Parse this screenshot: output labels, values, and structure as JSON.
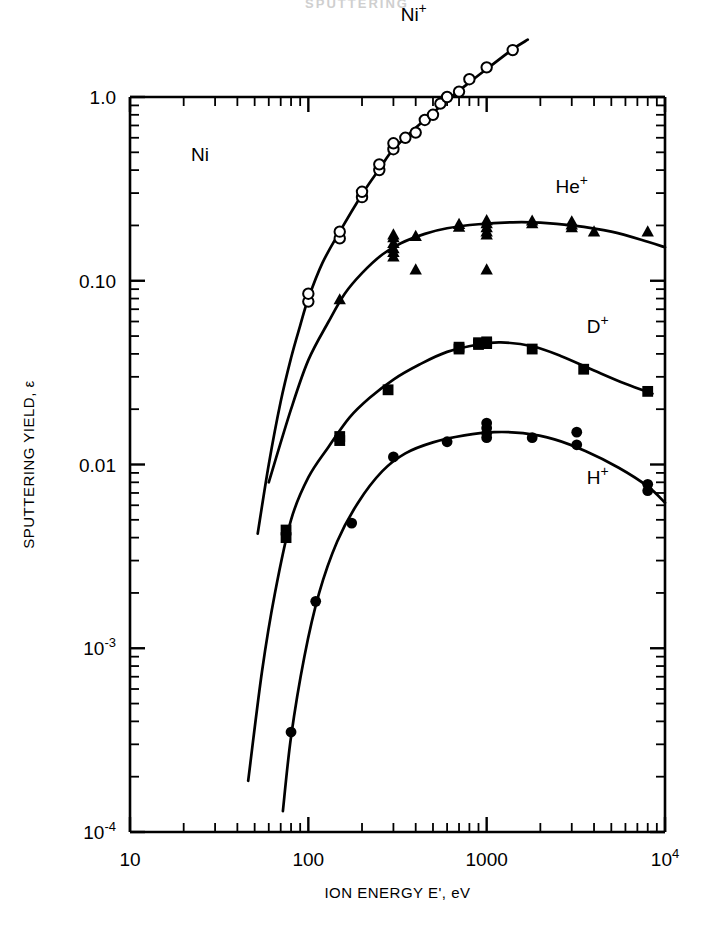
{
  "page": {
    "header_partial": "SPUTTERING"
  },
  "chart_data": {
    "type": "scatter",
    "title": "",
    "xlabel": "ION ENERGY E', eV",
    "ylabel": "SPUTTERING YIELD, ε",
    "xscale": "log",
    "yscale": "log",
    "xlim": [
      10,
      10000
    ],
    "ylim": [
      0.0001,
      1.0
    ],
    "grid": false,
    "legend_position": "inline-annotations",
    "annotations": [
      {
        "text": "Ni",
        "x": 22,
        "y": 0.45,
        "name": "target-material-label"
      }
    ],
    "xticks": [
      {
        "value": 10,
        "label": "10"
      },
      {
        "value": 100,
        "label": "100"
      },
      {
        "value": 1000,
        "label": "1000"
      },
      {
        "value": 10000,
        "label": "10",
        "sup": "4"
      }
    ],
    "yticks": [
      {
        "value": 1.0,
        "label": "1.0"
      },
      {
        "value": 0.1,
        "label": "0.10"
      },
      {
        "value": 0.01,
        "label": "0.01"
      },
      {
        "value": 0.001,
        "label": "10",
        "sup": "-3"
      },
      {
        "value": 0.0001,
        "label": "10",
        "sup": "-4"
      }
    ],
    "series": [
      {
        "name": "Ni+",
        "label": "Ni",
        "label_sup": "+",
        "label_x": 390,
        "label_y": 2.6,
        "marker": "open-circle",
        "points": [
          [
            100,
            0.077
          ],
          [
            100,
            0.085
          ],
          [
            150,
            0.17
          ],
          [
            150,
            0.185
          ],
          [
            200,
            0.285
          ],
          [
            200,
            0.305
          ],
          [
            250,
            0.4
          ],
          [
            250,
            0.43
          ],
          [
            300,
            0.52
          ],
          [
            300,
            0.56
          ],
          [
            350,
            0.6
          ],
          [
            400,
            0.64
          ],
          [
            450,
            0.75
          ],
          [
            500,
            0.8
          ],
          [
            550,
            0.92
          ],
          [
            600,
            1.0
          ],
          [
            700,
            1.07
          ],
          [
            800,
            1.25
          ],
          [
            1000,
            1.45
          ],
          [
            1400,
            1.8
          ]
        ],
        "curve": [
          [
            52,
            0.0042
          ],
          [
            60,
            0.01
          ],
          [
            70,
            0.022
          ],
          [
            80,
            0.038
          ],
          [
            90,
            0.057
          ],
          [
            100,
            0.08
          ],
          [
            120,
            0.125
          ],
          [
            150,
            0.185
          ],
          [
            200,
            0.295
          ],
          [
            250,
            0.405
          ],
          [
            300,
            0.52
          ],
          [
            400,
            0.68
          ],
          [
            500,
            0.82
          ],
          [
            600,
            0.96
          ],
          [
            800,
            1.2
          ],
          [
            1000,
            1.42
          ],
          [
            1400,
            1.82
          ],
          [
            1700,
            2.05
          ]
        ]
      },
      {
        "name": "He+",
        "label": "He",
        "label_sup": "+",
        "label_x": 3000,
        "label_y": 0.3,
        "marker": "filled-triangle",
        "points": [
          [
            150,
            0.079
          ],
          [
            300,
            0.135
          ],
          [
            300,
            0.143
          ],
          [
            300,
            0.15
          ],
          [
            300,
            0.16
          ],
          [
            300,
            0.172
          ],
          [
            300,
            0.178
          ],
          [
            400,
            0.175
          ],
          [
            400,
            0.115
          ],
          [
            700,
            0.196
          ],
          [
            700,
            0.203
          ],
          [
            1000,
            0.178
          ],
          [
            1000,
            0.185
          ],
          [
            1000,
            0.195
          ],
          [
            1000,
            0.205
          ],
          [
            1000,
            0.213
          ],
          [
            1000,
            0.115
          ],
          [
            1800,
            0.205
          ],
          [
            1800,
            0.212
          ],
          [
            3000,
            0.195
          ],
          [
            3000,
            0.202
          ],
          [
            3000,
            0.21
          ],
          [
            4000,
            0.185
          ],
          [
            8000,
            0.185
          ]
        ],
        "curve": [
          [
            60,
            0.008
          ],
          [
            80,
            0.02
          ],
          [
            100,
            0.037
          ],
          [
            130,
            0.06
          ],
          [
            160,
            0.085
          ],
          [
            200,
            0.11
          ],
          [
            260,
            0.139
          ],
          [
            330,
            0.16
          ],
          [
            450,
            0.18
          ],
          [
            600,
            0.193
          ],
          [
            900,
            0.203
          ],
          [
            1400,
            0.208
          ],
          [
            2000,
            0.207
          ],
          [
            3000,
            0.2
          ],
          [
            5000,
            0.185
          ],
          [
            8000,
            0.163
          ],
          [
            10000,
            0.152
          ]
        ]
      },
      {
        "name": "D+",
        "label": "D",
        "label_sup": "+",
        "label_x": 4200,
        "label_y": 0.052,
        "marker": "filled-square",
        "points": [
          [
            75,
            0.004
          ],
          [
            75,
            0.0044
          ],
          [
            150,
            0.0135
          ],
          [
            150,
            0.0142
          ],
          [
            280,
            0.0255
          ],
          [
            700,
            0.0425
          ],
          [
            700,
            0.0435
          ],
          [
            900,
            0.045
          ],
          [
            900,
            0.046
          ],
          [
            1000,
            0.0455
          ],
          [
            1000,
            0.0465
          ],
          [
            1800,
            0.0425
          ],
          [
            3500,
            0.033
          ],
          [
            8000,
            0.025
          ]
        ],
        "curve": [
          [
            46,
            0.00019
          ],
          [
            55,
            0.00075
          ],
          [
            65,
            0.002
          ],
          [
            80,
            0.005
          ],
          [
            100,
            0.0085
          ],
          [
            130,
            0.0125
          ],
          [
            170,
            0.018
          ],
          [
            220,
            0.023
          ],
          [
            300,
            0.029
          ],
          [
            420,
            0.035
          ],
          [
            600,
            0.041
          ],
          [
            900,
            0.045
          ],
          [
            1200,
            0.0462
          ],
          [
            1800,
            0.044
          ],
          [
            2600,
            0.039
          ],
          [
            4000,
            0.0325
          ],
          [
            6000,
            0.0275
          ],
          [
            8500,
            0.0243
          ]
        ]
      },
      {
        "name": "H+",
        "label": "H",
        "label_sup": "+",
        "label_x": 4200,
        "label_y": 0.0078,
        "marker": "filled-circle",
        "points": [
          [
            80,
            0.00035
          ],
          [
            110,
            0.0018
          ],
          [
            175,
            0.0048
          ],
          [
            300,
            0.011
          ],
          [
            600,
            0.0133
          ],
          [
            1000,
            0.014
          ],
          [
            1000,
            0.0148
          ],
          [
            1000,
            0.0158
          ],
          [
            1000,
            0.0168
          ],
          [
            1800,
            0.014
          ],
          [
            3200,
            0.015
          ],
          [
            3200,
            0.0128
          ],
          [
            8000,
            0.0078
          ],
          [
            8000,
            0.0072
          ]
        ],
        "curve": [
          [
            72,
            0.00013
          ],
          [
            80,
            0.00033
          ],
          [
            95,
            0.0009
          ],
          [
            115,
            0.002
          ],
          [
            145,
            0.0038
          ],
          [
            190,
            0.0062
          ],
          [
            260,
            0.0092
          ],
          [
            350,
            0.0115
          ],
          [
            500,
            0.0132
          ],
          [
            750,
            0.0144
          ],
          [
            1100,
            0.015
          ],
          [
            1600,
            0.0148
          ],
          [
            2400,
            0.0137
          ],
          [
            3600,
            0.0118
          ],
          [
            5500,
            0.0096
          ],
          [
            8000,
            0.0076
          ],
          [
            10000,
            0.0062
          ]
        ]
      }
    ]
  }
}
